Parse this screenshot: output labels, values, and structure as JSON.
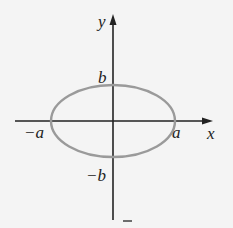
{
  "diagram": {
    "colors": {
      "background": "#f4f4f4",
      "axis": "#222222",
      "ellipse": "#9a9a9a",
      "text": "#222222"
    },
    "axes": {
      "x_label": "x",
      "y_label": "y"
    },
    "labels": {
      "pos_a": "a",
      "neg_a": "−a",
      "pos_b": "b",
      "neg_b": "−b"
    },
    "ellipse": {
      "cx": 113,
      "cy": 121,
      "rx": 62,
      "ry": 36
    },
    "stray_mark": "–"
  }
}
